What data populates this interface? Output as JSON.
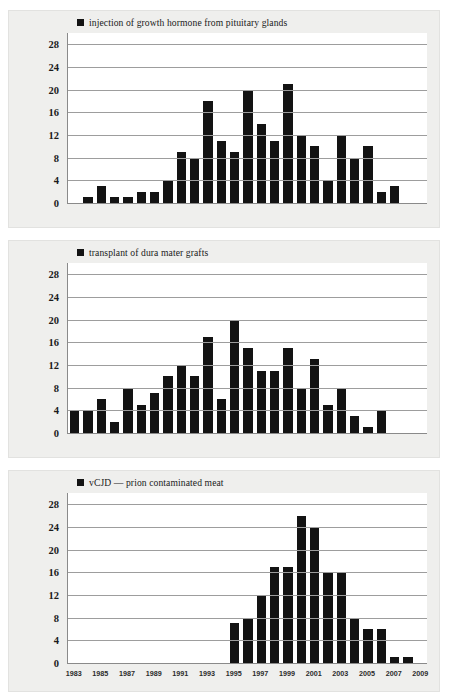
{
  "page": {
    "background": "#ffffff",
    "panel_background": "#efefed",
    "plot_background": "#ffffff",
    "bar_color": "#131313",
    "grid_color": "#9d9d9d",
    "axis_color": "#8a8a8a"
  },
  "chart_data": [
    {
      "type": "bar",
      "title": "injection of growth hormone from pituitary glands",
      "legend": [
        "injection of growth hormone from pituitary glands"
      ],
      "legend_position": "top-left",
      "xlabel": "",
      "ylabel": "",
      "ylim": [
        0,
        30
      ],
      "yticks": [
        0,
        4,
        8,
        12,
        16,
        20,
        24,
        28
      ],
      "grid": true,
      "x_range": [
        1983,
        2009
      ],
      "xticks": [
        1983,
        1985,
        1987,
        1989,
        1991,
        1993,
        1995,
        1997,
        1999,
        2001,
        2003,
        2005,
        2007,
        2009
      ],
      "categories": [
        1984,
        1985,
        1986,
        1987,
        1988,
        1989,
        1990,
        1991,
        1992,
        1993,
        1994,
        1995,
        1996,
        1997,
        1998,
        1999,
        2000,
        2001,
        2002,
        2003,
        2004,
        2005,
        2006,
        2007
      ],
      "values": [
        1,
        3,
        1,
        1,
        2,
        2,
        4,
        9,
        8,
        18,
        11,
        9,
        20,
        14,
        11,
        21,
        12,
        10,
        4,
        12,
        8,
        10,
        2,
        3
      ]
    },
    {
      "type": "bar",
      "title": "transplant of dura mater grafts",
      "legend": [
        "transplant of dura mater grafts"
      ],
      "legend_position": "top-left",
      "xlabel": "",
      "ylabel": "",
      "ylim": [
        0,
        30
      ],
      "yticks": [
        0,
        4,
        8,
        12,
        16,
        20,
        24,
        28
      ],
      "grid": true,
      "x_range": [
        1983,
        2009
      ],
      "xticks": [
        1983,
        1985,
        1987,
        1989,
        1991,
        1993,
        1995,
        1997,
        1999,
        2001,
        2003,
        2005,
        2007,
        2009
      ],
      "categories": [
        1983,
        1984,
        1985,
        1986,
        1987,
        1988,
        1989,
        1990,
        1991,
        1992,
        1993,
        1994,
        1995,
        1996,
        1997,
        1998,
        1999,
        2000,
        2001,
        2002,
        2003,
        2004,
        2005,
        2006,
        2007,
        2008
      ],
      "values": [
        4,
        4,
        6,
        2,
        8,
        5,
        7,
        10,
        12,
        10,
        17,
        6,
        20,
        15,
        11,
        11,
        15,
        8,
        13,
        5,
        8,
        3,
        1,
        4,
        0,
        0
      ]
    },
    {
      "type": "bar",
      "title": "vCJD — prion contaminated meat",
      "legend": [
        "vCJD — prion contaminated meat"
      ],
      "legend_position": "top-left",
      "xlabel": "",
      "ylabel": "",
      "ylim": [
        0,
        30
      ],
      "yticks": [
        0,
        4,
        8,
        12,
        16,
        20,
        24,
        28
      ],
      "grid": true,
      "x_range": [
        1983,
        2009
      ],
      "xticks": [
        1983,
        1985,
        1987,
        1989,
        1991,
        1993,
        1995,
        1997,
        1999,
        2001,
        2003,
        2005,
        2007,
        2009
      ],
      "categories": [
        1995,
        1996,
        1997,
        1998,
        1999,
        2000,
        2001,
        2002,
        2003,
        2004,
        2005,
        2006,
        2007,
        2008
      ],
      "values": [
        7,
        8,
        12,
        17,
        17,
        26,
        24,
        16,
        16,
        8,
        6,
        6,
        1,
        1
      ]
    }
  ]
}
